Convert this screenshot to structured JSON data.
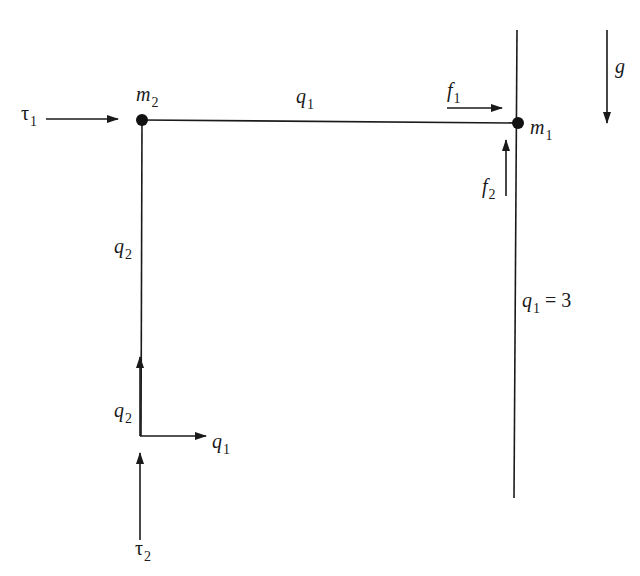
{
  "diagram": {
    "title": "",
    "colors": {
      "stroke": "#1a1a1a",
      "background": "#ffffff"
    },
    "masses": [
      {
        "id": "m2",
        "base": "m",
        "sub": "2",
        "x": 142,
        "y": 120
      },
      {
        "id": "m1",
        "base": "m",
        "sub": "1",
        "x": 518,
        "y": 123
      }
    ],
    "links": [
      {
        "id": "link-q1",
        "label": {
          "base": "q",
          "sub": "1"
        },
        "from": "m2",
        "to": "m1"
      },
      {
        "id": "link-q2",
        "label": {
          "base": "q",
          "sub": "2"
        },
        "from": "m2",
        "to": "origin"
      }
    ],
    "constraint_line": {
      "label": {
        "base": "q",
        "sub": "1",
        "eq": "= 3"
      }
    },
    "forces": [
      {
        "id": "tau1",
        "base": "τ",
        "sub": "1",
        "direction": "right"
      },
      {
        "id": "f1",
        "base": "f",
        "sub": "1",
        "direction": "right"
      },
      {
        "id": "f2",
        "base": "f",
        "sub": "2",
        "direction": "up"
      },
      {
        "id": "tau2",
        "base": "τ",
        "sub": "2",
        "direction": "up"
      }
    ],
    "gravity": {
      "label": "g",
      "direction": "down"
    },
    "axes": [
      {
        "id": "axis-q1",
        "base": "q",
        "sub": "1",
        "direction": "right"
      },
      {
        "id": "axis-q2",
        "base": "q",
        "sub": "2",
        "direction": "up"
      }
    ]
  }
}
